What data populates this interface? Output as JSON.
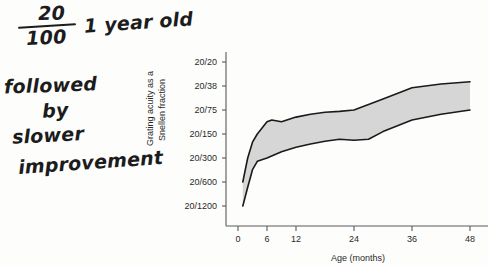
{
  "annotations": {
    "fraction_numerator": "20",
    "fraction_denominator": "100",
    "age_note": "1 year old",
    "line1": "followed",
    "line2": "by",
    "line3": "slower",
    "line4": "improvement"
  },
  "chart_data": {
    "type": "area",
    "title": "",
    "xlabel": "Age (months)",
    "ylabel": "Grating acuity as a Snellen fraction",
    "ylabel_line1": "Grating acuity as a",
    "ylabel_line2": "Snellen fraction",
    "x_ticks": [
      "0",
      "6",
      "12",
      "24",
      "36",
      "48"
    ],
    "x_tick_values": [
      0,
      6,
      12,
      24,
      36,
      48
    ],
    "y_ticks": [
      "20/20",
      "20/38",
      "20/75",
      "20/150",
      "20/300",
      "20/600",
      "20/1200"
    ],
    "y_tick_values": [
      20,
      38,
      75,
      150,
      300,
      600,
      1200
    ],
    "xlim": [
      0,
      50
    ],
    "grid": false,
    "legend": false,
    "band_fill_color": "#d6d6d6",
    "band_edge_color": "#1a1a1a",
    "series": [
      {
        "name": "upper bound (better acuity)",
        "x": [
          1,
          2,
          3,
          4,
          6,
          7,
          9,
          12,
          15,
          18,
          21,
          24,
          30,
          36,
          42,
          48
        ],
        "snellen_denominator": [
          600,
          300,
          190,
          150,
          105,
          100,
          105,
          92,
          85,
          80,
          78,
          75,
          55,
          40,
          36,
          34
        ]
      },
      {
        "name": "lower bound (poorer acuity)",
        "x": [
          1,
          2,
          3,
          4,
          6,
          9,
          12,
          15,
          18,
          21,
          24,
          27,
          30,
          36,
          42,
          48
        ],
        "snellen_denominator": [
          1200,
          700,
          420,
          330,
          300,
          250,
          220,
          200,
          185,
          175,
          180,
          175,
          140,
          100,
          85,
          75
        ]
      }
    ],
    "annotation_points": [
      {
        "x": 12,
        "label": "20/100",
        "note": "1 year old"
      }
    ]
  }
}
